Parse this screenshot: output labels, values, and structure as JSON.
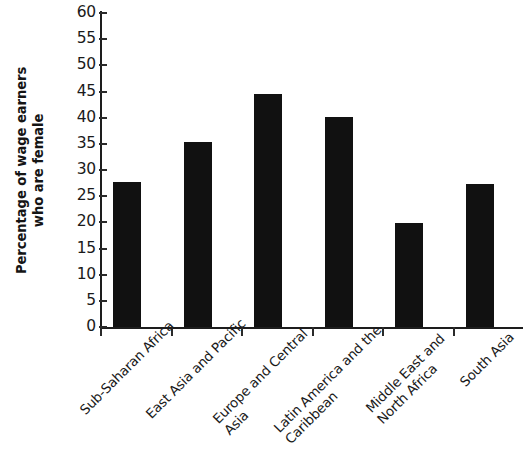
{
  "chart_data": {
    "type": "bar",
    "title": "",
    "subtitle": "",
    "xlabel": "",
    "ylabel": "Percentage of wage earners who are female",
    "ylabel_lines": [
      "Percentage of wage earners",
      "who are female"
    ],
    "categories": [
      "Sub-Saharan Africa",
      "East Asia and Pacific",
      "Europe and Central Asia",
      "Latin America and the Caribbean",
      "Middle East and North Africa",
      "South Asia"
    ],
    "category_lines": [
      [
        "Sub-Saharan Africa"
      ],
      [
        "East Asia and Pacific"
      ],
      [
        "Europe and Central",
        "Asia"
      ],
      [
        "Latin America and the",
        "Caribbean"
      ],
      [
        "Middle East and",
        "North Africa"
      ],
      [
        "South Asia"
      ]
    ],
    "values": [
      27.8,
      35.3,
      44.6,
      40.1,
      19.9,
      27.3
    ],
    "ylim": [
      0,
      60
    ],
    "ytick_values": [
      0,
      5,
      10,
      15,
      20,
      25,
      30,
      35,
      40,
      45,
      50,
      55,
      60
    ],
    "ytick_labels": [
      "0",
      "5",
      "10",
      "15",
      "20",
      "25",
      "30",
      "35",
      "40",
      "45",
      "50",
      "55",
      "60"
    ],
    "grid": false,
    "legend": false,
    "legend_position": "none",
    "bar_color": "#111111",
    "axis_color": "#1d1d1d",
    "background_color": "#ffffff",
    "label_rotation_degrees": -45
  }
}
